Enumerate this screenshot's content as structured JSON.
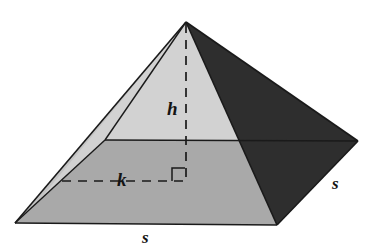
{
  "figure": {
    "name": "square-pyramid-with-height-and-apothem",
    "width": 369,
    "height": 249,
    "background_color": "#ffffff",
    "projection": "oblique-perspective"
  },
  "labels": {
    "height_label": "h",
    "apothem_label": "k",
    "base_edge_front_label": "s",
    "base_edge_right_label": "s"
  },
  "label_positions": {
    "height_label": {
      "x": 167,
      "y": 99
    },
    "apothem_label": {
      "x": 117,
      "y": 170
    },
    "base_edge_front_label": {
      "x": 142,
      "y": 229
    },
    "base_edge_right_label": {
      "x": 332,
      "y": 175
    }
  },
  "colors": {
    "front_left_face": "#d2d2d2",
    "right_face": "#2e2e2e",
    "base_front_region": "#a9a9a9",
    "back_sliver_face": "#c4c4c4",
    "outline": "#1a1a1a",
    "dashed_line": "#1a1a1a",
    "label_text": "#141414",
    "page_background": "#ffffff"
  },
  "geometry": {
    "apex": {
      "x": 186,
      "y": 22
    },
    "base_left_vertex": {
      "x": 15,
      "y": 223
    },
    "base_front_vertex": {
      "x": 277,
      "y": 225
    },
    "base_right_vertex": {
      "x": 358,
      "y": 141
    },
    "base_back_vertex_hidden": {
      "x": 105,
      "y": 140
    },
    "base_center": {
      "x": 186,
      "y": 180
    },
    "height_foot": {
      "x": 186,
      "y": 180
    },
    "apothem_endpoint_left": {
      "x": 62,
      "y": 181
    },
    "right_angle_marker": {
      "x": 172,
      "y": 167,
      "size": 13
    }
  },
  "faces": [
    {
      "name": "front-left-face",
      "fill": "#d2d2d2",
      "points": "186,22 15,223 105,140"
    },
    {
      "name": "right-face",
      "fill": "#2e2e2e",
      "points": "186,22 358,141 277,225"
    },
    {
      "name": "base-front-region",
      "fill": "#a9a9a9",
      "points": "15,223 105,140 358,141 277,225"
    },
    {
      "name": "back-left-sliver",
      "fill": "#c4c4c4",
      "points": "186,22 15,223 21,219"
    }
  ],
  "lines": {
    "height_dashed": {
      "from": {
        "x": 186,
        "y": 22
      },
      "to": {
        "x": 186,
        "y": 182
      },
      "style": "dashed"
    },
    "apothem_dashed": {
      "from": {
        "x": 62,
        "y": 181
      },
      "to": {
        "x": 186,
        "y": 181
      },
      "style": "dashed"
    },
    "base_back_edge": {
      "from": {
        "x": 105,
        "y": 140
      },
      "to": {
        "x": 358,
        "y": 141
      },
      "style": "solid"
    }
  },
  "icons": {
    "right_angle_marker": "right-angle-icon"
  }
}
